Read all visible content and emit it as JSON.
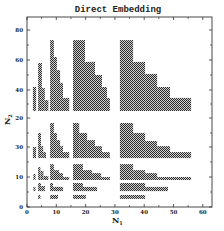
{
  "chart_data": {
    "type": "area",
    "title": "Direct Embedding",
    "xlabel": "N1",
    "ylabel": "N2",
    "xlim": [
      0,
      62
    ],
    "x_ticks": [
      0,
      10,
      20,
      30,
      40,
      50,
      60
    ],
    "y_tick_labels_as_shown": [
      "80",
      "60",
      "40",
      "20",
      "30",
      "10",
      "0"
    ],
    "grid": false,
    "legend": null,
    "note": "Staircase feasibility regions (checker-hatched). Upper panel uses N2 scale 30-80, lower panel uses N2 scale 0-30. Segments listed as [N1_start, N1_end, N2_top] with a shared N2_bottom per block.",
    "panels": {
      "upper": {
        "y_px_at_0": 150,
        "px_per_unit": 1.5
      },
      "lower": {
        "y_px_at_0": 207,
        "px_per_unit": 3
      }
    },
    "regions": [
      {
        "panel": "upper",
        "bottom": 26,
        "steps": [
          [
            2.0,
            3.1,
            42
          ]
        ]
      },
      {
        "panel": "upper",
        "bottom": 26,
        "steps": [
          [
            3.8,
            5.1,
            58
          ],
          [
            5.1,
            6.1,
            41.3
          ],
          [
            6.1,
            7.3,
            33.3
          ]
        ]
      },
      {
        "panel": "upper",
        "bottom": 26,
        "steps": [
          [
            7.9,
            9.2,
            73.3
          ],
          [
            9.2,
            10.2,
            62
          ],
          [
            10.2,
            11.3,
            53.3
          ],
          [
            11.3,
            12.3,
            44.7
          ],
          [
            12.3,
            14.4,
            34.7
          ]
        ]
      },
      {
        "panel": "upper",
        "bottom": 26,
        "steps": [
          [
            15.7,
            19.8,
            73.3
          ],
          [
            19.8,
            23.2,
            58.7
          ],
          [
            23.2,
            25.6,
            50
          ],
          [
            25.6,
            27.3,
            42
          ],
          [
            27.3,
            28.3,
            34.7
          ]
        ]
      },
      {
        "panel": "upper",
        "bottom": 26,
        "steps": [
          [
            31.7,
            36.2,
            73.3
          ],
          [
            36.2,
            40.3,
            58.7
          ],
          [
            40.3,
            44.4,
            50.7
          ],
          [
            44.4,
            48.8,
            42
          ],
          [
            48.8,
            56.0,
            34.7
          ]
        ]
      },
      {
        "panel": "lower",
        "bottom": 16.3,
        "steps": [
          [
            2.0,
            3.1,
            20
          ]
        ]
      },
      {
        "panel": "lower",
        "bottom": 16.3,
        "steps": [
          [
            3.8,
            4.8,
            24.7
          ],
          [
            4.8,
            5.5,
            20.3
          ],
          [
            5.5,
            6.5,
            18.3
          ]
        ]
      },
      {
        "panel": "lower",
        "bottom": 16.3,
        "steps": [
          [
            7.9,
            9.2,
            28
          ],
          [
            9.2,
            10.2,
            24.7
          ],
          [
            10.2,
            11.3,
            22.3
          ],
          [
            11.3,
            12.3,
            20.3
          ],
          [
            12.3,
            14.4,
            18.3
          ]
        ]
      },
      {
        "panel": "lower",
        "bottom": 16.3,
        "steps": [
          [
            15.7,
            17.8,
            28
          ],
          [
            17.8,
            20.5,
            24.7
          ],
          [
            20.5,
            23.2,
            22.3
          ],
          [
            23.2,
            25.6,
            20.3
          ],
          [
            25.6,
            28.3,
            18.3
          ]
        ]
      },
      {
        "panel": "lower",
        "bottom": 16.3,
        "steps": [
          [
            31.7,
            36.2,
            28
          ],
          [
            36.2,
            40.3,
            24.7
          ],
          [
            40.3,
            44.4,
            22.0
          ],
          [
            44.4,
            48.8,
            20.3
          ],
          [
            48.8,
            56.0,
            18.3
          ]
        ]
      },
      {
        "panel": "lower",
        "bottom": 9,
        "steps": [
          [
            2.2,
            2.9,
            11
          ]
        ]
      },
      {
        "panel": "lower",
        "bottom": 9,
        "steps": [
          [
            3.8,
            4.6,
            13.3
          ],
          [
            4.6,
            5.6,
            12
          ],
          [
            5.6,
            7.3,
            10.3
          ]
        ]
      },
      {
        "panel": "lower",
        "bottom": 9,
        "steps": [
          [
            7.9,
            9.2,
            14.3
          ],
          [
            9.2,
            10.9,
            12.3
          ],
          [
            10.9,
            12.3,
            11.3
          ],
          [
            12.3,
            14.4,
            10
          ]
        ]
      },
      {
        "panel": "lower",
        "bottom": 9,
        "steps": [
          [
            15.7,
            19.1,
            14.3
          ],
          [
            19.1,
            22.2,
            12.3
          ],
          [
            22.2,
            25.3,
            11.3
          ],
          [
            25.3,
            28.3,
            10
          ]
        ]
      },
      {
        "panel": "lower",
        "bottom": 9,
        "steps": [
          [
            31.7,
            36.2,
            14.3
          ],
          [
            36.2,
            40.3,
            12.3
          ],
          [
            40.3,
            44.4,
            11.3
          ],
          [
            44.4,
            56.0,
            10
          ]
        ]
      },
      {
        "panel": "lower",
        "bottom": 5.3,
        "steps": [
          [
            2.2,
            2.9,
            6.7
          ]
        ]
      },
      {
        "panel": "lower",
        "bottom": 5.3,
        "steps": [
          [
            3.8,
            4.8,
            8
          ],
          [
            4.8,
            6.1,
            7
          ]
        ]
      },
      {
        "panel": "lower",
        "bottom": 5.3,
        "steps": [
          [
            7.9,
            8.9,
            8
          ],
          [
            8.9,
            12.3,
            6.7
          ]
        ]
      },
      {
        "panel": "lower",
        "bottom": 5.3,
        "steps": [
          [
            15.7,
            19.1,
            8
          ],
          [
            19.1,
            23.9,
            6.7
          ]
        ]
      },
      {
        "panel": "lower",
        "bottom": 5.3,
        "steps": [
          [
            31.7,
            40.3,
            8
          ],
          [
            40.3,
            48.1,
            6.7
          ]
        ]
      },
      {
        "panel": "lower",
        "bottom": 2.7,
        "steps": [
          [
            3.8,
            4.6,
            4
          ]
        ]
      },
      {
        "panel": "lower",
        "bottom": 2.7,
        "steps": [
          [
            7.9,
            10.6,
            4
          ]
        ]
      },
      {
        "panel": "lower",
        "bottom": 2.7,
        "steps": [
          [
            15.7,
            20.1,
            4
          ]
        ]
      },
      {
        "panel": "lower",
        "bottom": 2.7,
        "steps": [
          [
            31.7,
            40.3,
            4
          ]
        ]
      }
    ]
  },
  "labels": {
    "title": "Direct Embedding",
    "xlabel_main": "N",
    "xlabel_sub": "1",
    "ylabel_main": "N",
    "ylabel_sub": "2"
  },
  "colors": {
    "fill_dark": "#2a2a2a",
    "fill_light": "#d8d8d8",
    "axis": "#333333"
  }
}
